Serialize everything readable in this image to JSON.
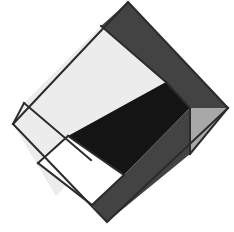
{
  "artwork": {
    "title": "Geometric Diamond Composition",
    "background_color": "#ffffff",
    "canvas": {
      "width": 234,
      "height": 232
    },
    "outline_color": "#2b2b2b",
    "outline_width": 2,
    "diamond_vertices": {
      "top": [
        128,
        2
      ],
      "right": [
        228,
        108
      ],
      "bottom": [
        107,
        222
      ],
      "left": [
        13,
        124
      ]
    },
    "palette": {
      "near_white": "#ffffff",
      "light_gray": "#ececec",
      "mid_gray": "#a8a8a8",
      "dark_gray": "#434343",
      "near_black": "#141414",
      "outline": "#2b2b2b"
    },
    "shapes": [
      {
        "name": "top-dark-gray-band",
        "label": "Top dark gray band",
        "fill": "#434343",
        "points": "128,2 228,108 190,108 166,82 101,26"
      },
      {
        "name": "upper-left-light-rectangle",
        "label": "Upper left light rectangle",
        "fill": "#ececec",
        "points": "101,26 166,82 91,160 24,103"
      },
      {
        "name": "left-light-triangle",
        "label": "Left light wedge",
        "fill": "#ececec",
        "points": "13,124 24,103 91,160 56,196"
      },
      {
        "name": "white-inner-square",
        "label": "White inner square",
        "fill": "#ffffff",
        "points": "68,136 124,175 92,205 38,163"
      },
      {
        "name": "black-diagonal-band",
        "label": "Black diagonal band",
        "fill": "#141414",
        "points": "166,82 190,108 124,175 68,136"
      },
      {
        "name": "bottom-dark-gray-band",
        "label": "Bottom dark gray band",
        "fill": "#434343",
        "points": "190,108 190,154 107,222 92,205 124,175"
      },
      {
        "name": "right-mid-gray-triangle",
        "label": "Right mid gray triangle",
        "fill": "#a8a8a8",
        "points": "190,108 228,108 190,154"
      },
      {
        "name": "bottom-left-white-wedge",
        "label": "Bottom left white wedge",
        "fill": "#ffffff",
        "points": "56,196 92,205 107,222"
      }
    ],
    "divider_lines": [
      {
        "name": "divider-top-band-lower-edge",
        "x1": 101,
        "y1": 26,
        "x2": 166,
        "y2": 82
      },
      {
        "name": "divider-light-rect-lower-edge",
        "x1": 24,
        "y1": 103,
        "x2": 91,
        "y2": 160
      },
      {
        "name": "divider-black-band-lower-edge",
        "x1": 68,
        "y1": 136,
        "x2": 124,
        "y2": 175
      },
      {
        "name": "divider-white-square-left",
        "x1": 68,
        "y1": 136,
        "x2": 38,
        "y2": 163
      },
      {
        "name": "divider-white-square-bottom",
        "x1": 38,
        "y1": 163,
        "x2": 92,
        "y2": 205
      },
      {
        "name": "divider-white-square-right",
        "x1": 92,
        "y1": 205,
        "x2": 124,
        "y2": 175
      },
      {
        "name": "divider-left-wedge-edge",
        "x1": 24,
        "y1": 103,
        "x2": 13,
        "y2": 124
      },
      {
        "name": "divider-right-vertical",
        "x1": 190,
        "y1": 108,
        "x2": 190,
        "y2": 154
      },
      {
        "name": "divider-gray-triangle-lower",
        "x1": 190,
        "y1": 154,
        "x2": 228,
        "y2": 108
      },
      {
        "name": "divider-band-right-edge",
        "x1": 166,
        "y1": 82,
        "x2": 190,
        "y2": 108
      }
    ]
  }
}
